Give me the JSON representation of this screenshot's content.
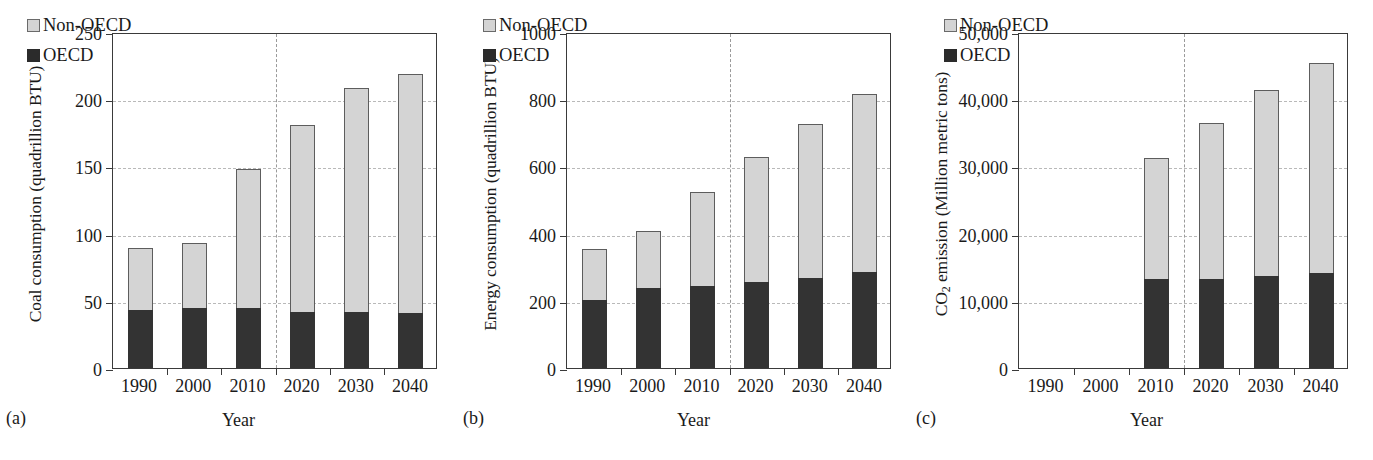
{
  "figure": {
    "panels": [
      {
        "tag": "(a)",
        "ylabel": "Coal consumption (quadrillion BTU)",
        "xlabel": "Year"
      },
      {
        "tag": "(b)",
        "ylabel": "Energy consumption (quadrillion BTU)",
        "xlabel": "Year"
      },
      {
        "tag": "(c)",
        "ylabel_pre": "CO",
        "ylabel_sub": "2",
        "ylabel_post": " emission (Million metric tons)",
        "xlabel": "Year"
      }
    ],
    "legend": {
      "non_oecd": "Non-OECD",
      "oecd": "OECD",
      "color_non_oecd": "#d4d4d4",
      "color_oecd": "#333333"
    },
    "colors": {
      "axis": "#3a3a3a",
      "grid": "#b9b9b9",
      "divider": "#9a9a9a",
      "text": "#1a1a1a",
      "background": "#ffffff"
    }
  },
  "chart_data": [
    {
      "type": "bar",
      "stacked": true,
      "panel": "(a)",
      "title": "",
      "xlabel": "Year",
      "ylabel": "Coal consumption (quadrillion BTU)",
      "categories": [
        "1990",
        "2000",
        "2010",
        "2020",
        "2030",
        "2040"
      ],
      "ylim": [
        0,
        250
      ],
      "yticks": [
        0,
        50,
        100,
        150,
        200,
        250
      ],
      "yticklabels": [
        "0",
        "50",
        "100",
        "150",
        "200",
        "250"
      ],
      "grid": "horizontal-dashed",
      "legend_position": "upper-left",
      "projection_divider_after": "2010",
      "series": [
        {
          "name": "OECD",
          "color": "#333333",
          "values": [
            43,
            45,
            45,
            42,
            42,
            41
          ]
        },
        {
          "name": "Non-OECD",
          "color": "#d4d4d4",
          "values": [
            46,
            48,
            103,
            139,
            166,
            178
          ]
        }
      ],
      "totals": [
        89,
        93,
        148,
        181,
        208,
        219
      ]
    },
    {
      "type": "bar",
      "stacked": true,
      "panel": "(b)",
      "title": "",
      "xlabel": "Year",
      "ylabel": "Energy consumption (quadrillion BTU)",
      "categories": [
        "1990",
        "2000",
        "2010",
        "2020",
        "2030",
        "2040"
      ],
      "ylim": [
        0,
        1000
      ],
      "yticks": [
        0,
        200,
        400,
        600,
        800,
        1000
      ],
      "yticklabels": [
        "0",
        "200",
        "400",
        "600",
        "800",
        "1000"
      ],
      "grid": "horizontal-dashed",
      "legend_position": "upper-left",
      "projection_divider_after": "2010",
      "series": [
        {
          "name": "OECD",
          "color": "#333333",
          "values": [
            202,
            238,
            245,
            255,
            268,
            285
          ]
        },
        {
          "name": "Non-OECD",
          "color": "#d4d4d4",
          "values": [
            153,
            169,
            279,
            374,
            458,
            532
          ]
        }
      ],
      "totals": [
        355,
        407,
        524,
        629,
        726,
        817
      ]
    },
    {
      "type": "bar",
      "stacked": true,
      "panel": "(c)",
      "title": "",
      "xlabel": "Year",
      "ylabel": "CO2 emission (Million metric tons)",
      "categories": [
        "1990",
        "2000",
        "2010",
        "2020",
        "2030",
        "2040"
      ],
      "ylim": [
        0,
        50000
      ],
      "yticks": [
        0,
        10000,
        20000,
        30000,
        40000,
        50000
      ],
      "yticklabels": [
        "0",
        "10,000",
        "20,000",
        "30,000",
        "40,000",
        "50,000"
      ],
      "grid": "horizontal-dashed",
      "legend_position": "upper-left",
      "projection_divider_after": "2010",
      "series": [
        {
          "name": "OECD",
          "color": "#333333",
          "values": [
            null,
            null,
            13200,
            13200,
            13700,
            14200
          ]
        },
        {
          "name": "Non-OECD",
          "color": "#d4d4d4",
          "values": [
            null,
            null,
            18000,
            23200,
            27700,
            31200
          ]
        }
      ],
      "totals": [
        null,
        null,
        31200,
        36400,
        41400,
        45400
      ]
    }
  ]
}
